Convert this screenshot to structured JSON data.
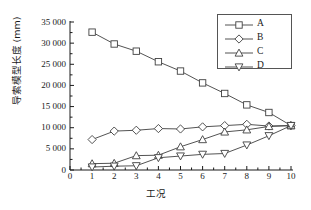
{
  "chart_data": {
    "type": "line",
    "title": "",
    "xlabel": "工况",
    "ylabel": "导索模型长度 (mm)",
    "x": [
      1,
      2,
      3,
      4,
      5,
      6,
      7,
      8,
      9,
      10
    ],
    "xlim": [
      0,
      10
    ],
    "ylim": [
      0,
      35000
    ],
    "grid": false,
    "legend_position": "top-right",
    "xticks": [
      "0",
      "1",
      "2",
      "3",
      "4",
      "5",
      "6",
      "7",
      "8",
      "9",
      "10"
    ],
    "yticks": [
      "0",
      "5 000",
      "10 000",
      "15 000",
      "20 000",
      "25 000",
      "30 000",
      "35 000"
    ],
    "ytick_values": [
      0,
      5000,
      10000,
      15000,
      20000,
      25000,
      30000,
      35000
    ],
    "series": [
      {
        "name": "A",
        "marker": "square",
        "values": [
          32600,
          29800,
          28100,
          25600,
          23400,
          20600,
          18100,
          15400,
          13600,
          10500
        ]
      },
      {
        "name": "B",
        "marker": "diamond",
        "values": [
          7200,
          9200,
          9400,
          9800,
          9700,
          10200,
          10500,
          10800,
          10400,
          10500
        ]
      },
      {
        "name": "C",
        "marker": "triangle-up",
        "values": [
          1500,
          1600,
          3400,
          3500,
          5500,
          7200,
          9000,
          9500,
          10300,
          10500
        ]
      },
      {
        "name": "D",
        "marker": "triangle-down",
        "values": [
          700,
          900,
          1000,
          2900,
          3300,
          3700,
          3900,
          5900,
          8100,
          10500
        ]
      }
    ]
  },
  "legend": {
    "entries": [
      {
        "label": "A",
        "marker": "square"
      },
      {
        "label": "B",
        "marker": "diamond"
      },
      {
        "label": "C",
        "marker": "triangle-up"
      },
      {
        "label": "D",
        "marker": "triangle-down"
      }
    ]
  },
  "colors": {
    "line": "#404040",
    "marker_stroke": "#404040",
    "marker_fill": "#ffffff",
    "axis": "#1a1a1a",
    "text": "#1a1a1a",
    "background": "#ffffff"
  }
}
